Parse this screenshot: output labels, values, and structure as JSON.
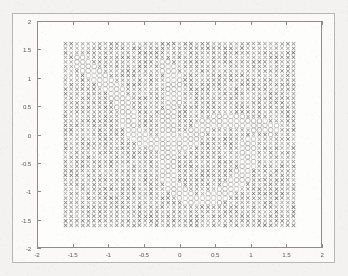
{
  "figure": {
    "title": "",
    "xlabel": "",
    "ylabel": "",
    "background_color": "#f3f2f0",
    "axes_color": "#8e8c8a",
    "tick_label_color": "#5f5d5b"
  },
  "chart_data": {
    "type": "scatter",
    "title": "",
    "xlabel": "",
    "ylabel": "",
    "xlim": [
      -2,
      2
    ],
    "ylim": [
      -2,
      2
    ],
    "xticks": [
      -2,
      -1.5,
      -1,
      -0.5,
      0,
      0.5,
      1,
      1.5,
      2
    ],
    "yticks": [
      -2,
      -1.5,
      -1,
      -0.5,
      0,
      0.5,
      1,
      1.5,
      2
    ],
    "xticklabels": [
      "-2",
      "-1.5",
      "-1",
      "-0.5",
      "0",
      "0.5",
      "1",
      "1.5",
      "2"
    ],
    "yticklabels": [
      "-2",
      "-1.5",
      "-1",
      "-0.5",
      "0",
      "0.5",
      "1",
      "1.5",
      "2"
    ],
    "grid": false,
    "legend": null,
    "legend_position": "none",
    "grid_spec": {
      "x_min": -1.6,
      "x_max": 1.6,
      "y_min": -1.6,
      "y_max": 1.6,
      "step": 0.08,
      "points_per_side": 41,
      "total_points": 1681
    },
    "series": [
      {
        "name": "class-x",
        "marker": "x",
        "color": "#6e6c6a",
        "marker_size": 4.2,
        "count_approx": 1430
      },
      {
        "name": "class-o",
        "marker": "o",
        "color": "#9a9896",
        "marker_size": 5.0,
        "count_approx": 251
      }
    ],
    "boundary": {
      "shape": "s-curve-band",
      "band_half_width": 0.115,
      "control_points": [
        [
          -1.4,
          1.3
        ],
        [
          -1.15,
          1.05
        ],
        [
          -0.95,
          0.82
        ],
        [
          -0.8,
          0.55
        ],
        [
          -0.72,
          0.25
        ],
        [
          -0.62,
          0.0
        ],
        [
          -0.45,
          -0.12
        ],
        [
          -0.2,
          -0.17
        ],
        [
          0.05,
          -0.15
        ],
        [
          0.22,
          -0.02
        ],
        [
          0.3,
          0.12
        ],
        [
          0.45,
          0.2
        ],
        [
          0.75,
          0.22
        ],
        [
          1.05,
          0.18
        ],
        [
          1.3,
          0.1
        ]
      ],
      "secondary_control_points": [
        [
          -0.18,
          1.22
        ],
        [
          -0.1,
          1.05
        ],
        [
          -0.08,
          0.8
        ],
        [
          -0.12,
          0.5
        ],
        [
          -0.16,
          0.2
        ],
        [
          -0.18,
          -0.1
        ],
        [
          -0.18,
          -0.45
        ],
        [
          -0.14,
          -0.75
        ],
        [
          -0.02,
          -1.0
        ],
        [
          0.2,
          -1.15
        ],
        [
          0.48,
          -1.12
        ],
        [
          0.72,
          -0.95
        ],
        [
          0.88,
          -0.7
        ],
        [
          0.96,
          -0.4
        ],
        [
          1.0,
          -0.12
        ]
      ]
    }
  }
}
